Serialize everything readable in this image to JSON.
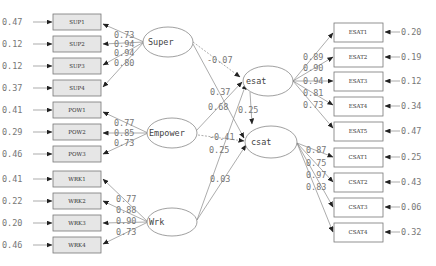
{
  "diagram": {
    "type": "structural equation model path diagram",
    "latent": {
      "super": {
        "label": "Super"
      },
      "empower": {
        "label": "Empower"
      },
      "wrk": {
        "label": "Wrk"
      },
      "esat": {
        "label": "esat"
      },
      "csat": {
        "label": "csat"
      }
    },
    "left_indicators": [
      {
        "label": "SUP1",
        "error": "0.47",
        "loading": "0.73"
      },
      {
        "label": "SUP2",
        "error": "0.12",
        "loading": "0.94"
      },
      {
        "label": "SUP3",
        "error": "0.12",
        "loading": "0.94"
      },
      {
        "label": "SUP4",
        "error": "0.37",
        "loading": "0.80"
      },
      {
        "label": "POW1",
        "error": "0.41",
        "loading": "0.77"
      },
      {
        "label": "POW2",
        "error": "0.29",
        "loading": "0.85"
      },
      {
        "label": "POW3",
        "error": "0.46",
        "loading": "0.73"
      },
      {
        "label": "WRK1",
        "error": "0.41",
        "loading": "0.77"
      },
      {
        "label": "WRK2",
        "error": "0.22",
        "loading": "0.88"
      },
      {
        "label": "WRK3",
        "error": "0.20",
        "loading": "0.90"
      },
      {
        "label": "WRK4",
        "error": "0.46",
        "loading": "0.73"
      }
    ],
    "right_indicators": [
      {
        "label": "ESAT1",
        "error": "0.20",
        "loading": "0.89"
      },
      {
        "label": "ESAT2",
        "error": "0.19",
        "loading": "0.90"
      },
      {
        "label": "ESAT3",
        "error": "0.12",
        "loading": "0.94"
      },
      {
        "label": "ESAT4",
        "error": "0.34",
        "loading": "0.81"
      },
      {
        "label": "ESAT5",
        "error": "0.47",
        "loading": "0.73"
      },
      {
        "label": "CSAT1",
        "error": "0.25",
        "loading": "0.87"
      },
      {
        "label": "CSAT2",
        "error": "0.43",
        "loading": "0.75"
      },
      {
        "label": "CSAT3",
        "error": "0.06",
        "loading": "0.97"
      },
      {
        "label": "CSAT4",
        "error": "0.32",
        "loading": "0.83"
      }
    ],
    "paths": {
      "super_esat": "-0.07",
      "super_csat": "0.37",
      "empower_esat": "0.68",
      "empower_csat": "-0.41",
      "wrk_esat": "0.25",
      "wrk_csat": "0.03",
      "esat_csat": "0.25"
    }
  }
}
